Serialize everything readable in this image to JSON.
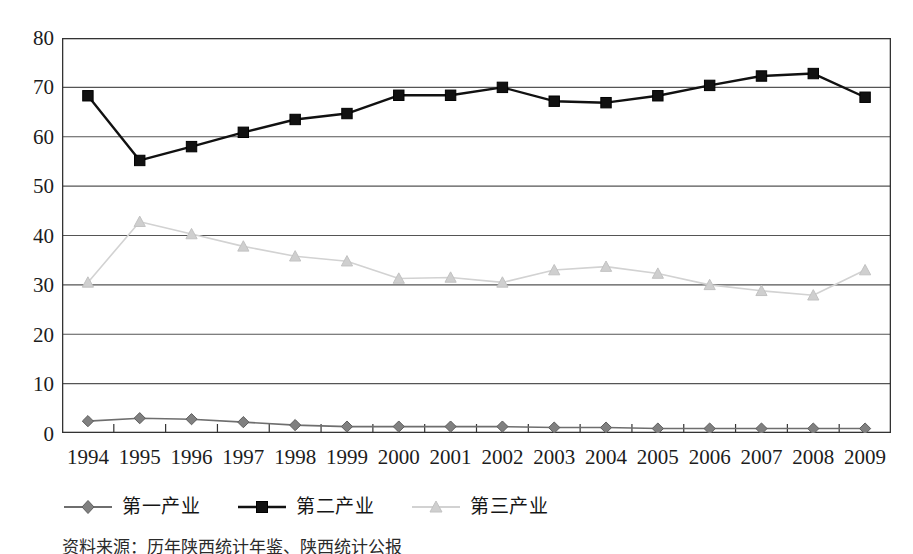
{
  "chart_data": {
    "type": "line",
    "title": "",
    "subtitle": "",
    "xlabel": "",
    "ylabel": "",
    "ylim": [
      0,
      80
    ],
    "ytick_step": 10,
    "yticks": [
      "0",
      "10",
      "20",
      "30",
      "40",
      "50",
      "60",
      "70",
      "80"
    ],
    "grid": "horizontal",
    "legend_position": "bottom",
    "categories": [
      "1994",
      "1995",
      "1996",
      "1997",
      "1998",
      "1999",
      "2000",
      "2001",
      "2002",
      "2003",
      "2004",
      "2005",
      "2006",
      "2007",
      "2008",
      "2009"
    ],
    "series": [
      {
        "name": "第一产业",
        "marker": "diamond",
        "color": "#808080",
        "line_color": "#6e6e6e",
        "values": [
          2.4,
          3.0,
          2.8,
          2.2,
          1.6,
          1.3,
          1.3,
          1.3,
          1.3,
          1.1,
          1.1,
          0.9,
          0.9,
          0.9,
          0.9,
          0.9
        ]
      },
      {
        "name": "第二产业",
        "marker": "square",
        "color": "#111111",
        "line_color": "#111111",
        "values": [
          68.3,
          55.2,
          58.0,
          60.9,
          63.5,
          64.7,
          68.4,
          68.4,
          70.0,
          67.2,
          66.9,
          68.3,
          70.4,
          72.3,
          72.8,
          68.0
        ]
      },
      {
        "name": "第三产业",
        "marker": "triangle",
        "color": "#cfcfcf",
        "line_color": "#d2d2d2",
        "values": [
          30.5,
          42.8,
          40.3,
          37.8,
          35.8,
          34.8,
          31.3,
          31.5,
          30.5,
          33.0,
          33.7,
          32.3,
          30.0,
          28.8,
          27.9,
          33.0
        ]
      }
    ],
    "axis_color": "#333333",
    "gridline_color": "#555555",
    "background": "#ffffff"
  },
  "legend": {
    "items": [
      {
        "label": "第一产业"
      },
      {
        "label": "第二产业"
      },
      {
        "label": "第三产业"
      }
    ]
  },
  "source_note": "资料来源：历年陕西统计年鉴、陕西统计公报"
}
